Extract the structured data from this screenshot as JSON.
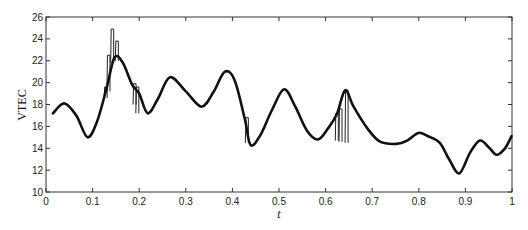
{
  "chart_data": {
    "type": "line",
    "title": "",
    "xlabel": "t",
    "ylabel": "VTEC",
    "xlim": [
      0,
      1
    ],
    "ylim": [
      10,
      26
    ],
    "grid": false,
    "legend": null,
    "x_ticks": [
      "0",
      "0.1",
      "0.2",
      "0.3",
      "0.4",
      "0.5",
      "0.6",
      "0.7",
      "0.8",
      "0.9",
      "1"
    ],
    "y_ticks": [
      "10",
      "12",
      "14",
      "16",
      "18",
      "20",
      "22",
      "24",
      "26"
    ],
    "series": [
      {
        "name": "smooth VTEC",
        "style": "thick",
        "x": [
          0.015,
          0.039,
          0.065,
          0.089,
          0.11,
          0.13,
          0.147,
          0.165,
          0.185,
          0.2,
          0.218,
          0.24,
          0.266,
          0.3,
          0.334,
          0.36,
          0.384,
          0.405,
          0.427,
          0.439,
          0.46,
          0.485,
          0.511,
          0.535,
          0.56,
          0.584,
          0.605,
          0.624,
          0.642,
          0.66,
          0.69,
          0.717,
          0.752,
          0.775,
          0.799,
          0.82,
          0.845,
          0.865,
          0.887,
          0.91,
          0.931,
          0.95,
          0.967,
          0.985,
          0.999
        ],
        "y": [
          17.2,
          18.1,
          17.0,
          15.0,
          16.5,
          19.5,
          22.3,
          21.8,
          19.8,
          19.0,
          17.2,
          18.5,
          20.5,
          19.2,
          17.8,
          19.2,
          21.0,
          20.2,
          16.6,
          14.3,
          15.2,
          17.5,
          19.4,
          17.8,
          15.6,
          14.8,
          15.8,
          17.1,
          19.3,
          17.8,
          15.8,
          14.6,
          14.4,
          14.7,
          15.4,
          15.1,
          14.5,
          13.0,
          11.7,
          13.6,
          14.7,
          14.1,
          13.4,
          14.0,
          15.1
        ]
      },
      {
        "name": "raw VTEC spikes",
        "style": "thin",
        "segments": [
          {
            "t": 0.128,
            "from": 18.6,
            "to": 19.6
          },
          {
            "t": 0.134,
            "from": 19.2,
            "to": 22.5
          },
          {
            "t": 0.142,
            "from": 21.8,
            "to": 24.9
          },
          {
            "t": 0.152,
            "from": 22.0,
            "to": 23.8
          },
          {
            "t": 0.19,
            "from": 18.0,
            "to": 19.9
          },
          {
            "t": 0.196,
            "from": 17.2,
            "to": 19.6
          },
          {
            "t": 0.431,
            "from": 14.5,
            "to": 16.8
          },
          {
            "t": 0.624,
            "from": 14.7,
            "to": 17.2
          },
          {
            "t": 0.632,
            "from": 14.6,
            "to": 17.6
          },
          {
            "t": 0.645,
            "from": 14.5,
            "to": 19.3
          }
        ]
      }
    ]
  }
}
